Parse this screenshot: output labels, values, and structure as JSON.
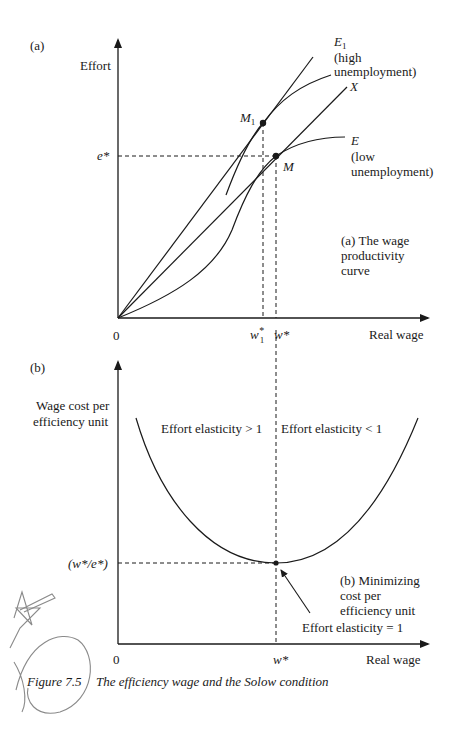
{
  "panel_a": {
    "label": "(a)",
    "y_axis_label": "Effort",
    "x_axis_label": "Real wage",
    "origin": "0",
    "e_star": "e*",
    "w1_star": "w",
    "w1_star_sup": "*",
    "w1_star_sub": "1",
    "w_star": "w*",
    "point_m1": "M",
    "point_m1_sub": "1",
    "point_m": "M",
    "curve_e1": "E",
    "curve_e1_sub": "1",
    "curve_e1_note1": "(high",
    "curve_e1_note2": "unemployment)",
    "ray_x": "X",
    "curve_e": "E",
    "curve_e_note1": "(low",
    "curve_e_note2": "unemployment)",
    "title_line1": "(a) The wage",
    "title_line2": "productivity",
    "title_line3": "curve"
  },
  "panel_b": {
    "label": "(b)",
    "y_axis_label_line1": "Wage cost per",
    "y_axis_label_line2": "efficiency unit",
    "x_axis_label": "Real wage",
    "origin": "0",
    "w_star": "w*",
    "min_value": "(w*/e*)",
    "region_left": "Effort elasticity > 1",
    "region_right": "Effort elasticity < 1",
    "title_line1": "(b) Minimizing",
    "title_line2": "cost per",
    "title_line3": "efficiency unit",
    "arrow_note": "Effort elasticity = 1"
  },
  "caption": {
    "number": "Figure 7.5",
    "text": "The efficiency wage and the Solow condition"
  },
  "colors": {
    "ink": "#1a1a1a",
    "pencil": "#8a8a8a",
    "background": "#ffffff"
  }
}
